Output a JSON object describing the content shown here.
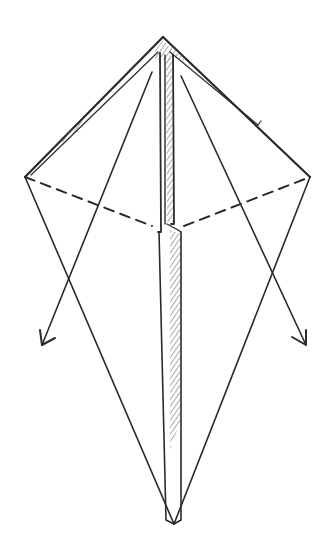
{
  "diagram": {
    "type": "origami-fold-step",
    "colors": {
      "line": "#2a2a2a",
      "background": "#ffffff",
      "hatch": "#555555"
    },
    "points": {
      "top": [
        163,
        37
      ],
      "left": [
        25,
        177
      ],
      "right": [
        310,
        177
      ],
      "bottom": [
        174,
        524
      ],
      "center_left": [
        160,
        228
      ],
      "center_right": [
        176,
        228
      ]
    },
    "fold_lines": {
      "dashed_left": [
        [
          25,
          177
        ],
        [
          158,
          226
        ]
      ],
      "dashed_right": [
        [
          176,
          226
        ],
        [
          310,
          177
        ]
      ]
    },
    "arrows": [
      {
        "name": "left-arrow",
        "from": [
          152,
          72
        ],
        "to": [
          42,
          345
        ]
      },
      {
        "name": "right-arrow",
        "from": [
          181,
          76
        ],
        "to": [
          306,
          345
        ]
      }
    ]
  }
}
